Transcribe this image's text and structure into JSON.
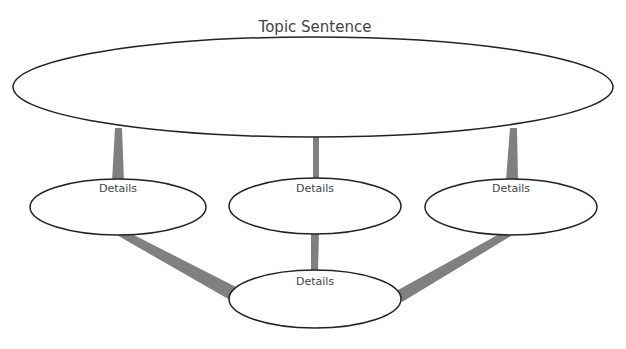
{
  "diagram": {
    "title": "Topic Sentence",
    "details": [
      {
        "label": "Details"
      },
      {
        "label": "Details"
      },
      {
        "label": "Details"
      },
      {
        "label": "Details"
      }
    ],
    "colors": {
      "outline": "#222222",
      "connector": "#808080",
      "text": "#444444",
      "background": "#ffffff"
    }
  }
}
